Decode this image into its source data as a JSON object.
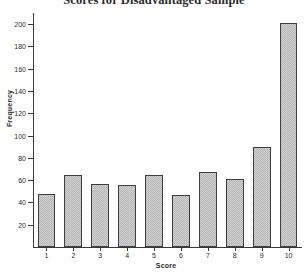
{
  "chart_data": {
    "type": "bar",
    "title": "Scores for Disadvantaged Sample",
    "xlabel": "Score",
    "ylabel": "Frequency",
    "categories": [
      "1",
      "2",
      "3",
      "4",
      "5",
      "6",
      "7",
      "8",
      "9",
      "10"
    ],
    "values": [
      48,
      65,
      57,
      56,
      65,
      47,
      67,
      61,
      90,
      201
    ],
    "ylim": [
      0,
      210
    ],
    "xlim": [
      0.4,
      10.6
    ],
    "yticks": [
      20,
      40,
      60,
      80,
      100,
      120,
      140,
      160,
      180,
      200
    ],
    "ytick_labels": [
      "20",
      "40",
      "60",
      "80",
      "100",
      "120",
      "140",
      "160",
      "180",
      "200"
    ],
    "grid": false,
    "legend": null,
    "legend_position": "none",
    "bar_fill_color": "#b6b6b6",
    "bar_edge_color": "#3f3f3f",
    "axis_color": "#3a3a3a",
    "background_color": "#ffffff"
  }
}
